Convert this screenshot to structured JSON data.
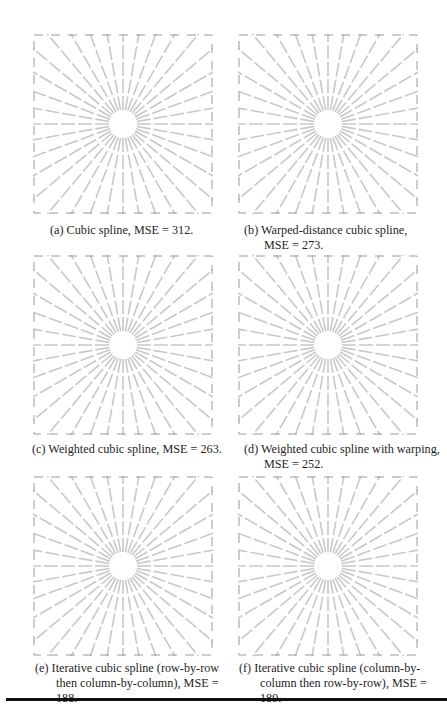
{
  "figure": {
    "panels": [
      {
        "id": "a",
        "label": "(a)",
        "caption": "Cubic spline, MSE = 312.",
        "mse": 312
      },
      {
        "id": "b",
        "label": "(b)",
        "caption_line1": "Warped-distance cubic spline,",
        "caption_line2": "MSE = 273.",
        "mse": 273
      },
      {
        "id": "c",
        "label": "(c)",
        "caption": "Weighted cubic spline, MSE = 263.",
        "mse": 263
      },
      {
        "id": "d",
        "label": "(d)",
        "caption_line1": "Weighted cubic spline with warping,",
        "caption_line2": "MSE = 252.",
        "mse": 252
      },
      {
        "id": "e",
        "label": "(e)",
        "caption_line1": "Iterative cubic spline (row-by-row",
        "caption_line2": "then column-by-column), MSE = 188.",
        "mse": 188
      },
      {
        "id": "f",
        "label": "(f)",
        "caption_line1": "Iterative cubic spline (column-by-",
        "caption_line2": "column then row-by-row), MSE = 189.",
        "mse": 189
      }
    ],
    "image_content": "starburst-test-pattern",
    "line_color": "#c8c8c8"
  }
}
